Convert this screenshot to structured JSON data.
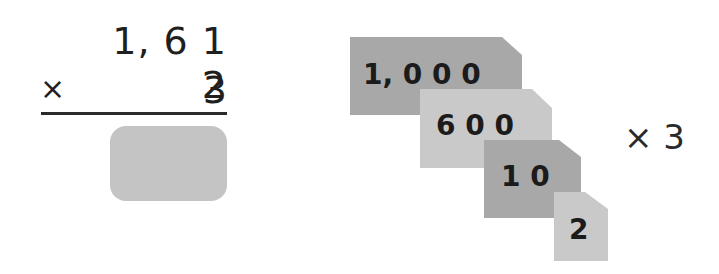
{
  "vertical_multiplication": {
    "multiplicand": "1, 6 1 2",
    "operator": "×",
    "multiplier": "3",
    "answer": ""
  },
  "place_value_cards": [
    {
      "label": "1, 0 0 0",
      "value": 1000,
      "shade": "dark"
    },
    {
      "label": "6 0 0",
      "value": 600,
      "shade": "light"
    },
    {
      "label": "1 0",
      "value": 10,
      "shade": "dark"
    },
    {
      "label": "2",
      "value": 2,
      "shade": "light"
    }
  ],
  "cards_multiplier": "× 3",
  "colors": {
    "card_dark": "#a8a8a8",
    "card_light": "#c9c9c9",
    "answer_box": "#c4c4c4",
    "text": "#1f1f1f"
  }
}
